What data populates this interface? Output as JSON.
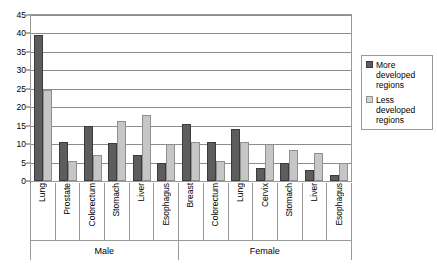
{
  "chart_data": {
    "type": "bar",
    "title": "",
    "xlabel": "",
    "ylabel": "",
    "ylim": [
      0,
      45
    ],
    "yticks": [
      0,
      5,
      10,
      15,
      20,
      25,
      30,
      35,
      40,
      45
    ],
    "grid": true,
    "legend_position": "right",
    "categories": [
      "Lung",
      "Prostate",
      "Colorectum",
      "Stomach",
      "Liver",
      "Esophagus",
      "Breast",
      "Colorectum",
      "Lung",
      "Cervix",
      "Stomach",
      "Liver",
      "Esophagus"
    ],
    "group_labels": [
      "Male",
      "Female"
    ],
    "group_spans": [
      6,
      7
    ],
    "series": [
      {
        "name": "More developed regions",
        "color": "#5d5d5d",
        "values": [
          39.5,
          10.5,
          15.0,
          10.2,
          7.0,
          5.0,
          15.5,
          10.5,
          14.0,
          3.5,
          5.0,
          3.0,
          1.5
        ]
      },
      {
        "name": "Less developed regions",
        "color": "#c6c6c6",
        "values": [
          24.7,
          5.5,
          7.0,
          16.3,
          18.0,
          10.0,
          10.5,
          5.5,
          10.5,
          10.0,
          8.5,
          7.5,
          5.0
        ]
      }
    ]
  },
  "legend": {
    "items": [
      {
        "label_line1": "More",
        "label_line2": "developed",
        "label_line3": "regions"
      },
      {
        "label_line1": "Less",
        "label_line2": "developed",
        "label_line3": "regions"
      }
    ]
  }
}
